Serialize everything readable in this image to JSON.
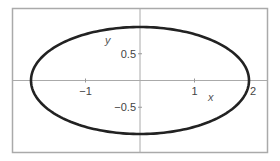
{
  "chart_data": {
    "type": "line",
    "title": "",
    "xlabel": "x",
    "ylabel": "y",
    "equation": "x^2/4 + y^2 = 1",
    "series": [
      {
        "name": "ellipse",
        "parametric": {
          "x": "2*cos(t)",
          "y": "sin(t)",
          "t_range": [
            0,
            6.2832
          ]
        },
        "color": "#222222"
      }
    ],
    "x_ticks": [
      {
        "value": -1,
        "label": "−1"
      },
      {
        "value": 1,
        "label": "1"
      },
      {
        "value": 2,
        "label": "2"
      }
    ],
    "y_ticks": [
      {
        "value": 0.5,
        "label": "0.5"
      },
      {
        "value": -0.5,
        "label": "−0.5"
      }
    ],
    "xlim": [
      -2.5,
      2.35
    ],
    "ylim": [
      -1.35,
      1.35
    ],
    "grid": false,
    "legend": null,
    "frame": true,
    "axes_through_origin": true
  },
  "colors": {
    "curve": "#222222",
    "axes": "#999999",
    "frame": "#aaaaaa",
    "text": "#444444"
  }
}
